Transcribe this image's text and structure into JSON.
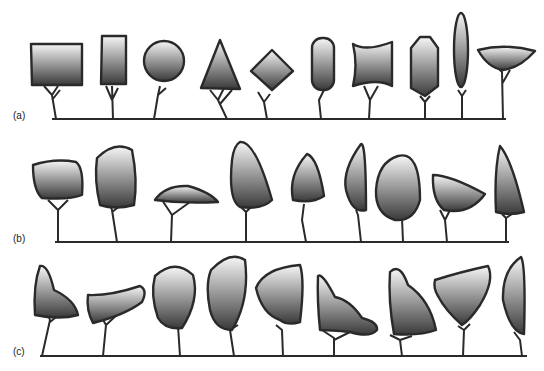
{
  "figure": {
    "colors": {
      "outline": "#2a2a2a",
      "gradient_top": "#f4f4f4",
      "gradient_bottom": "#3a3a3a",
      "ground": "#2a2a2a"
    },
    "rows": [
      {
        "label": "(a)",
        "theme": "geometric shapes",
        "shapes": [
          "rectangle-wide",
          "rectangle-tall",
          "circle",
          "triangle",
          "diamond",
          "rounded-capsule",
          "concave-hourglass",
          "hexagon",
          "tall-ellipse",
          "bowl-fan"
        ]
      },
      {
        "label": "(b)",
        "theme": "simplified natural forms",
        "shapes": [
          "rounded-box",
          "tall-rounded-box",
          "flat-umbrella",
          "tall-teardrop",
          "small-teardrop",
          "leaning-half-ellipse",
          "rounded-egg",
          "wedge",
          "tall-spire"
        ]
      },
      {
        "label": "(c)",
        "theme": "irregular organic forms",
        "shapes": [
          "lopsided-peak",
          "cloud-flat",
          "balloon",
          "tall-balloon",
          "irregular-blob",
          "stepped-cloud",
          "shark-fin",
          "heart-triangle",
          "crescent-tall"
        ]
      }
    ]
  }
}
